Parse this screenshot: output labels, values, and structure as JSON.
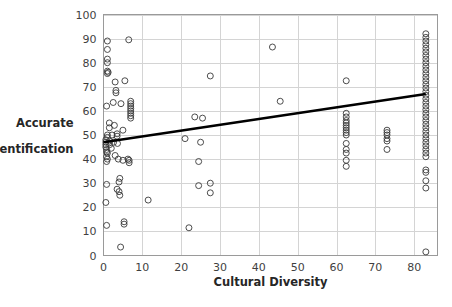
{
  "chart_data": {
    "type": "scatter",
    "title": "",
    "xlabel": "Cultural Diversity",
    "ylabel": "Accurate Identification",
    "ylabel_line1": "Accurate",
    "ylabel_line2": "Identification",
    "xlim": [
      0,
      86
    ],
    "ylim": [
      0,
      100
    ],
    "xticks": [
      0,
      10,
      20,
      30,
      40,
      50,
      60,
      70,
      80
    ],
    "yticks": [
      0,
      10,
      20,
      30,
      40,
      50,
      60,
      70,
      80,
      90,
      100
    ],
    "xtick_labels": [
      "0",
      "10",
      "20",
      "30",
      "40",
      "50",
      "60",
      "70",
      "80"
    ],
    "ytick_labels": [
      "0",
      "10",
      "20",
      "30",
      "40",
      "50",
      "60",
      "70",
      "80",
      "90",
      "100"
    ],
    "grid": true,
    "grid_axis": "both",
    "legend": false,
    "marker": "open-circle",
    "marker_color": "#3a3a3a",
    "trendline": {
      "show": true,
      "color": "#000000",
      "x0": 0.0,
      "y0": 47.0,
      "x1": 83.0,
      "y1": 67.0
    },
    "points": [
      [
        1.0,
        89.0
      ],
      [
        1.0,
        85.5
      ],
      [
        1.0,
        81.5
      ],
      [
        1.0,
        80.0
      ],
      [
        1.0,
        76.5
      ],
      [
        1.0,
        75.5
      ],
      [
        1.2,
        76.0
      ],
      [
        6.5,
        89.5
      ],
      [
        3.0,
        72.0
      ],
      [
        5.5,
        72.5
      ],
      [
        3.2,
        68.5
      ],
      [
        3.2,
        67.5
      ],
      [
        0.8,
        62.0
      ],
      [
        2.5,
        63.5
      ],
      [
        4.5,
        63.0
      ],
      [
        7.0,
        64.0
      ],
      [
        7.0,
        63.0
      ],
      [
        7.0,
        62.0
      ],
      [
        7.0,
        61.0
      ],
      [
        7.0,
        60.0
      ],
      [
        7.0,
        59.0
      ],
      [
        7.0,
        58.0
      ],
      [
        7.0,
        57.0
      ],
      [
        1.5,
        55.0
      ],
      [
        1.5,
        53.0
      ],
      [
        2.8,
        54.0
      ],
      [
        5.0,
        52.0
      ],
      [
        1.0,
        50.0
      ],
      [
        1.0,
        49.0
      ],
      [
        2.2,
        50.0
      ],
      [
        3.5,
        50.5
      ],
      [
        3.5,
        49.5
      ],
      [
        0.6,
        48.0
      ],
      [
        0.6,
        47.0
      ],
      [
        0.6,
        46.0
      ],
      [
        0.6,
        45.0
      ],
      [
        1.6,
        47.5
      ],
      [
        1.6,
        46.0
      ],
      [
        2.6,
        47.0
      ],
      [
        3.6,
        46.5
      ],
      [
        0.8,
        44.0
      ],
      [
        0.8,
        43.0
      ],
      [
        1.0,
        42.5
      ],
      [
        2.0,
        44.5
      ],
      [
        0.8,
        41.0
      ],
      [
        1.0,
        40.0
      ],
      [
        0.8,
        39.0
      ],
      [
        3.0,
        41.5
      ],
      [
        3.8,
        40.0
      ],
      [
        5.0,
        39.5
      ],
      [
        6.3,
        40.0
      ],
      [
        6.6,
        39.5
      ],
      [
        6.6,
        38.5
      ],
      [
        4.2,
        32.0
      ],
      [
        4.0,
        30.5
      ],
      [
        0.8,
        29.5
      ],
      [
        3.5,
        27.5
      ],
      [
        4.0,
        26.5
      ],
      [
        4.2,
        25.0
      ],
      [
        0.6,
        22.0
      ],
      [
        11.5,
        23.0
      ],
      [
        0.8,
        12.5
      ],
      [
        5.3,
        14.0
      ],
      [
        5.3,
        13.0
      ],
      [
        4.4,
        3.5
      ],
      [
        22.0,
        11.5
      ],
      [
        24.5,
        39.0
      ],
      [
        24.5,
        29.0
      ],
      [
        27.5,
        30.0
      ],
      [
        27.5,
        26.0
      ],
      [
        21.0,
        48.5
      ],
      [
        25.0,
        47.0
      ],
      [
        23.5,
        57.5
      ],
      [
        25.5,
        57.0
      ],
      [
        27.5,
        74.5
      ],
      [
        43.5,
        86.5
      ],
      [
        45.5,
        64.0
      ],
      [
        62.5,
        72.5
      ],
      [
        62.5,
        59.0
      ],
      [
        62.5,
        57.5
      ],
      [
        62.5,
        56.0
      ],
      [
        62.5,
        55.0
      ],
      [
        62.5,
        54.0
      ],
      [
        62.5,
        53.0
      ],
      [
        62.5,
        52.0
      ],
      [
        62.5,
        51.0
      ],
      [
        62.5,
        50.0
      ],
      [
        62.5,
        46.5
      ],
      [
        62.5,
        44.0
      ],
      [
        62.5,
        42.5
      ],
      [
        62.5,
        39.5
      ],
      [
        62.5,
        37.0
      ],
      [
        73.0,
        52.0
      ],
      [
        73.0,
        51.0
      ],
      [
        73.0,
        50.0
      ],
      [
        73.0,
        48.5
      ],
      [
        73.0,
        47.5
      ],
      [
        73.0,
        44.0
      ],
      [
        83.0,
        92.0
      ],
      [
        83.0,
        90.5
      ],
      [
        83.0,
        89.0
      ],
      [
        83.0,
        87.5
      ],
      [
        83.0,
        86.0
      ],
      [
        83.0,
        84.5
      ],
      [
        83.0,
        83.0
      ],
      [
        83.0,
        81.5
      ],
      [
        83.0,
        80.0
      ],
      [
        83.0,
        78.5
      ],
      [
        83.0,
        77.0
      ],
      [
        83.0,
        75.5
      ],
      [
        83.0,
        74.0
      ],
      [
        83.0,
        72.5
      ],
      [
        83.0,
        71.0
      ],
      [
        83.0,
        69.5
      ],
      [
        83.0,
        68.0
      ],
      [
        83.0,
        66.5
      ],
      [
        83.0,
        65.0
      ],
      [
        83.0,
        63.5
      ],
      [
        83.0,
        62.0
      ],
      [
        83.0,
        60.5
      ],
      [
        83.0,
        59.0
      ],
      [
        83.0,
        57.5
      ],
      [
        83.0,
        56.0
      ],
      [
        83.0,
        54.5
      ],
      [
        83.0,
        53.0
      ],
      [
        83.0,
        51.5
      ],
      [
        83.0,
        50.0
      ],
      [
        83.0,
        48.5
      ],
      [
        83.0,
        47.0
      ],
      [
        83.0,
        45.5
      ],
      [
        83.0,
        44.0
      ],
      [
        83.0,
        42.5
      ],
      [
        83.0,
        41.0
      ],
      [
        83.0,
        35.5
      ],
      [
        83.0,
        34.5
      ],
      [
        83.0,
        31.0
      ],
      [
        83.0,
        28.0
      ],
      [
        83.0,
        1.5
      ]
    ]
  },
  "caption": ""
}
